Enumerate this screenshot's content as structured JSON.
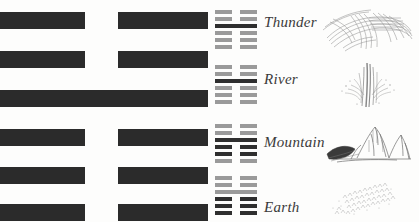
{
  "page": {
    "background_color": "#fdfdfc",
    "ink_color": "#2b2b2b",
    "mini_ink_color": "#9a9a9a",
    "mini_ink_dark_color": "#2f2f2f"
  },
  "main_hexagram": {
    "name": "main-hexagram",
    "lines_top_to_bottom": [
      "broken",
      "broken",
      "solid",
      "broken",
      "broken",
      "broken"
    ]
  },
  "rows": [
    {
      "label": "Thunder",
      "art_icon": "thunder-swirl-icon",
      "hexagram_lines_top_to_bottom": [
        "broken",
        "broken",
        "solid",
        "broken",
        "broken",
        "broken"
      ],
      "emphasis_line_index": 2
    },
    {
      "label": "River",
      "art_icon": "river-splash-icon",
      "hexagram_lines_top_to_bottom": [
        "broken",
        "broken",
        "solid",
        "broken",
        "broken",
        "broken"
      ],
      "emphasis_line_index": 2
    },
    {
      "label": "Mountain",
      "art_icon": "mountain-peak-icon",
      "hexagram_lines_top_to_bottom": [
        "broken",
        "broken",
        "solid",
        "broken",
        "broken",
        "broken"
      ],
      "emphasis_line_index": 2
    },
    {
      "label": "Earth",
      "art_icon": "earth-scatter-icon",
      "hexagram_lines_top_to_bottom": [
        "broken",
        "broken",
        "solid",
        "broken",
        "broken",
        "broken"
      ],
      "emphasis_line_index": 2
    }
  ]
}
